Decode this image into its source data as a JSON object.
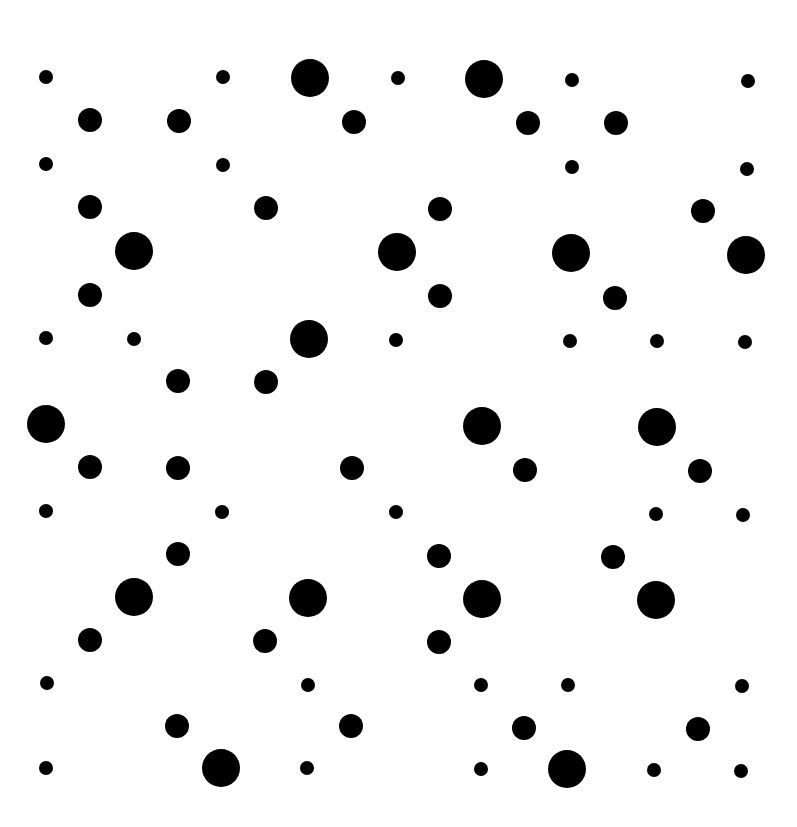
{
  "canvas": {
    "width": 797,
    "height": 827,
    "background": "#ffffff",
    "dot_color": "#000000"
  },
  "sizes": {
    "s": 14,
    "m": 24,
    "l": 38
  },
  "dots": [
    {
      "x": 46,
      "y": 77,
      "s": "s"
    },
    {
      "x": 223,
      "y": 77,
      "s": "s"
    },
    {
      "x": 310,
      "y": 78,
      "s": "l"
    },
    {
      "x": 398,
      "y": 78,
      "s": "s"
    },
    {
      "x": 484,
      "y": 79,
      "s": "l"
    },
    {
      "x": 572,
      "y": 80,
      "s": "s"
    },
    {
      "x": 748,
      "y": 81,
      "s": "s"
    },
    {
      "x": 90,
      "y": 120,
      "s": "m"
    },
    {
      "x": 179,
      "y": 121,
      "s": "m"
    },
    {
      "x": 354,
      "y": 122,
      "s": "m"
    },
    {
      "x": 528,
      "y": 123,
      "s": "m"
    },
    {
      "x": 616,
      "y": 123,
      "s": "m"
    },
    {
      "x": 46,
      "y": 164,
      "s": "s"
    },
    {
      "x": 223,
      "y": 165,
      "s": "s"
    },
    {
      "x": 572,
      "y": 167,
      "s": "s"
    },
    {
      "x": 747,
      "y": 169,
      "s": "s"
    },
    {
      "x": 90,
      "y": 207,
      "s": "m"
    },
    {
      "x": 266,
      "y": 208,
      "s": "m"
    },
    {
      "x": 440,
      "y": 209,
      "s": "m"
    },
    {
      "x": 703,
      "y": 211,
      "s": "m"
    },
    {
      "x": 134,
      "y": 251,
      "s": "l"
    },
    {
      "x": 397,
      "y": 252,
      "s": "l"
    },
    {
      "x": 571,
      "y": 253,
      "s": "l"
    },
    {
      "x": 746,
      "y": 255,
      "s": "l"
    },
    {
      "x": 90,
      "y": 295,
      "s": "m"
    },
    {
      "x": 440,
      "y": 296,
      "s": "m"
    },
    {
      "x": 615,
      "y": 298,
      "s": "m"
    },
    {
      "x": 46,
      "y": 338,
      "s": "s"
    },
    {
      "x": 134,
      "y": 339,
      "s": "s"
    },
    {
      "x": 309,
      "y": 339,
      "s": "l"
    },
    {
      "x": 396,
      "y": 340,
      "s": "s"
    },
    {
      "x": 570,
      "y": 341,
      "s": "s"
    },
    {
      "x": 657,
      "y": 341,
      "s": "s"
    },
    {
      "x": 745,
      "y": 342,
      "s": "s"
    },
    {
      "x": 178,
      "y": 381,
      "s": "m"
    },
    {
      "x": 266,
      "y": 382,
      "s": "m"
    },
    {
      "x": 46,
      "y": 424,
      "s": "l"
    },
    {
      "x": 482,
      "y": 426,
      "s": "l"
    },
    {
      "x": 657,
      "y": 427,
      "s": "l"
    },
    {
      "x": 90,
      "y": 467,
      "s": "m"
    },
    {
      "x": 178,
      "y": 468,
      "s": "m"
    },
    {
      "x": 352,
      "y": 468,
      "s": "m"
    },
    {
      "x": 525,
      "y": 470,
      "s": "m"
    },
    {
      "x": 700,
      "y": 471,
      "s": "m"
    },
    {
      "x": 46,
      "y": 511,
      "s": "s"
    },
    {
      "x": 222,
      "y": 512,
      "s": "s"
    },
    {
      "x": 396,
      "y": 512,
      "s": "s"
    },
    {
      "x": 656,
      "y": 514,
      "s": "s"
    },
    {
      "x": 743,
      "y": 515,
      "s": "s"
    },
    {
      "x": 178,
      "y": 554,
      "s": "m"
    },
    {
      "x": 439,
      "y": 556,
      "s": "m"
    },
    {
      "x": 613,
      "y": 557,
      "s": "m"
    },
    {
      "x": 134,
      "y": 597,
      "s": "l"
    },
    {
      "x": 308,
      "y": 598,
      "s": "l"
    },
    {
      "x": 482,
      "y": 599,
      "s": "l"
    },
    {
      "x": 656,
      "y": 600,
      "s": "l"
    },
    {
      "x": 90,
      "y": 640,
      "s": "m"
    },
    {
      "x": 265,
      "y": 641,
      "s": "m"
    },
    {
      "x": 439,
      "y": 642,
      "s": "m"
    },
    {
      "x": 47,
      "y": 683,
      "s": "s"
    },
    {
      "x": 308,
      "y": 685,
      "s": "s"
    },
    {
      "x": 481,
      "y": 685,
      "s": "s"
    },
    {
      "x": 568,
      "y": 685,
      "s": "s"
    },
    {
      "x": 742,
      "y": 686,
      "s": "s"
    },
    {
      "x": 177,
      "y": 726,
      "s": "m"
    },
    {
      "x": 351,
      "y": 726,
      "s": "m"
    },
    {
      "x": 524,
      "y": 728,
      "s": "m"
    },
    {
      "x": 698,
      "y": 729,
      "s": "m"
    },
    {
      "x": 46,
      "y": 768,
      "s": "s"
    },
    {
      "x": 221,
      "y": 768,
      "s": "l"
    },
    {
      "x": 307,
      "y": 768,
      "s": "s"
    },
    {
      "x": 481,
      "y": 769,
      "s": "s"
    },
    {
      "x": 567,
      "y": 769,
      "s": "l"
    },
    {
      "x": 654,
      "y": 770,
      "s": "s"
    },
    {
      "x": 741,
      "y": 771,
      "s": "s"
    }
  ]
}
